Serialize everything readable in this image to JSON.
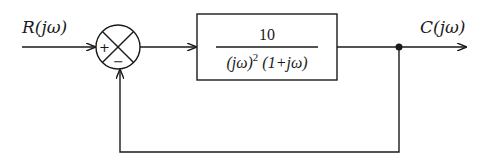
{
  "diagram": {
    "type": "block-diagram",
    "input_label": "R(jω)",
    "output_label": "C(jω)",
    "summing_junction": {
      "positive_sign": "+",
      "negative_sign": "−"
    },
    "forward_block": {
      "numerator": "10",
      "denominator_prefix": "(jω)",
      "denominator_exponent": "2",
      "denominator_suffix": "(1+jω)"
    },
    "feedback": "unity",
    "takeoff_point": true
  }
}
